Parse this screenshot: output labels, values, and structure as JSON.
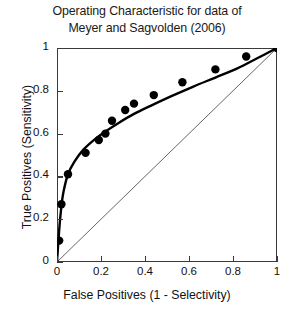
{
  "chart_data": {
    "type": "scatter",
    "title": "Operating Characteristic for data of Meyer and Sagvolden (2006)",
    "title_line1": "Operating Characteristic for data of",
    "title_line2": "Meyer and Sagvolden (2006)",
    "xlabel": "False Positives (1 - Selectivity)",
    "ylabel": "True Positives (Sensitivity)",
    "xlim": [
      0,
      1
    ],
    "ylim": [
      0,
      1
    ],
    "xticks": [
      0,
      0.2,
      0.4,
      0.6,
      0.8,
      1
    ],
    "yticks": [
      0,
      0.2,
      0.4,
      0.6,
      0.8,
      1
    ],
    "xticklabels": [
      "0",
      "0.2",
      "0.4",
      "0.6",
      "0.8",
      "1"
    ],
    "yticklabels": [
      "0",
      "0.2",
      "0.4",
      "0.6",
      "0.8",
      "1"
    ],
    "grid": false,
    "legend": false,
    "series": [
      {
        "name": "ROC data points",
        "marker": "filled-circle",
        "color": "#000000",
        "x": [
          0.01,
          0.02,
          0.05,
          0.13,
          0.19,
          0.22,
          0.25,
          0.31,
          0.35,
          0.44,
          0.57,
          0.72,
          0.86,
          1.0
        ],
        "y": [
          0.1,
          0.27,
          0.41,
          0.51,
          0.57,
          0.6,
          0.66,
          0.71,
          0.74,
          0.78,
          0.84,
          0.9,
          0.96,
          1.0
        ]
      },
      {
        "name": "fitted ROC curve",
        "marker": "none",
        "style": "solid-thick",
        "color": "#000000",
        "x": [
          0.0,
          0.01,
          0.02,
          0.03,
          0.05,
          0.08,
          0.12,
          0.17,
          0.22,
          0.28,
          0.35,
          0.43,
          0.52,
          0.62,
          0.72,
          0.82,
          0.91,
          1.0
        ],
        "y": [
          0.0,
          0.15,
          0.26,
          0.33,
          0.41,
          0.47,
          0.525,
          0.572,
          0.61,
          0.65,
          0.692,
          0.732,
          0.775,
          0.82,
          0.862,
          0.905,
          0.952,
          1.0
        ]
      },
      {
        "name": "chance diagonal",
        "marker": "none",
        "style": "solid-thin",
        "color": "#555555",
        "x": [
          0,
          1
        ],
        "y": [
          0,
          1
        ]
      }
    ]
  }
}
